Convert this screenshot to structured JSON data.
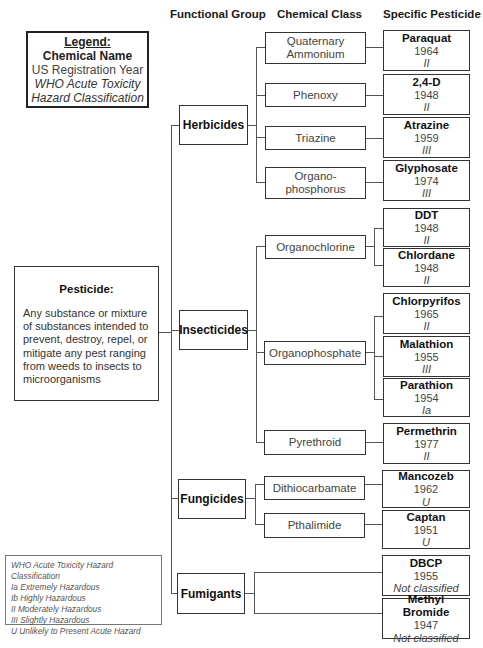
{
  "headers": {
    "functional_group": "Functional Group",
    "chemical_class": "Chemical Class",
    "specific_pesticide": "Specific Pesticide"
  },
  "legend": {
    "title": "Legend:",
    "name": "Chemical Name",
    "year": "US Registration Year",
    "hazard_line1": "WHO Acute Toxicity",
    "hazard_line2": "Hazard Classification"
  },
  "definition": {
    "title": "Pesticide:",
    "body": "Any substance or mixture of substances intended to prevent, destroy, repel, or mitigate any pest ranging from weeds to insects to microorganisms"
  },
  "hazard_key": {
    "title": "WHO Acute Toxicity Hazard Classification",
    "items": [
      "Ia Extremely Hazardous",
      "Ib Highly Hazardous",
      "II Moderately Hazardous",
      "III Slightly Hazardous",
      "U Unlikely to Present Acute Hazard"
    ]
  },
  "groups": [
    {
      "label": "Herbicides"
    },
    {
      "label": "Insecticides"
    },
    {
      "label": "Fungicides"
    },
    {
      "label": "Fumigants"
    }
  ],
  "classes": [
    {
      "line1": "Quaternary",
      "line2": "Ammonium"
    },
    {
      "line1": "Phenoxy",
      "line2": ""
    },
    {
      "line1": "Triazine",
      "line2": ""
    },
    {
      "line1": "Organo-",
      "line2": "phosphorus"
    },
    {
      "line1": "Organochlorine",
      "line2": ""
    },
    {
      "line1": "Organophosphate",
      "line2": ""
    },
    {
      "line1": "Pyrethroid",
      "line2": ""
    },
    {
      "line1": "Dithiocarbamate",
      "line2": ""
    },
    {
      "line1": "Pthalimide",
      "line2": ""
    }
  ],
  "pesticides": [
    {
      "name": "Paraquat",
      "year": "1964",
      "hazard": "II"
    },
    {
      "name": "2,4-D",
      "year": "1948",
      "hazard": "II"
    },
    {
      "name": "Atrazine",
      "year": "1959",
      "hazard": "III"
    },
    {
      "name": "Glyphosate",
      "year": "1974",
      "hazard": "III"
    },
    {
      "name": "DDT",
      "year": "1948",
      "hazard": "II"
    },
    {
      "name": "Chlordane",
      "year": "1948",
      "hazard": "II"
    },
    {
      "name": "Chlorpyrifos",
      "year": "1965",
      "hazard": "II"
    },
    {
      "name": "Malathion",
      "year": "1955",
      "hazard": "III"
    },
    {
      "name": "Parathion",
      "year": "1954",
      "hazard": "Ia"
    },
    {
      "name": "Permethrin",
      "year": "1977",
      "hazard": "II"
    },
    {
      "name": "Mancozeb",
      "year": "1962",
      "hazard": "U"
    },
    {
      "name": "Captan",
      "year": "1951",
      "hazard": "U"
    },
    {
      "name": "DBCP",
      "year": "1955",
      "hazard": "Not classified"
    },
    {
      "name": "Methyl Bromide",
      "year": "1947",
      "hazard": "Not classified"
    }
  ]
}
